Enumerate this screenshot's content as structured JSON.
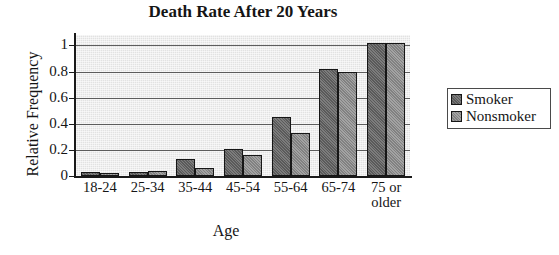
{
  "chart_data": {
    "type": "bar",
    "title": "Death Rate After 20 Years",
    "xlabel": "Age",
    "ylabel": "Relative Frequency",
    "categories": [
      "18-24",
      "25-34",
      "35-44",
      "45-54",
      "55-64",
      "65-74",
      "75 or\nolder"
    ],
    "series": [
      {
        "name": "Smoker",
        "color": "#6e6e6e",
        "values": [
          0.03,
          0.03,
          0.13,
          0.21,
          0.45,
          0.82,
          1.02
        ]
      },
      {
        "name": "Nonsmoker",
        "color": "#949494",
        "values": [
          0.02,
          0.035,
          0.06,
          0.16,
          0.33,
          0.8,
          1.02
        ]
      }
    ],
    "ylim": [
      0,
      1.08
    ],
    "yticks": [
      0,
      0.2,
      0.4,
      0.6,
      0.8,
      1
    ],
    "ytick_labels": [
      "0",
      "0.2",
      "0.4",
      "0.6",
      "0.8",
      "1"
    ],
    "grid": true,
    "legend_position": "right",
    "plot_background": "#e2e2e2",
    "axis_color": "#1a1a1a"
  },
  "legend": {
    "items": [
      {
        "label": "Smoker"
      },
      {
        "label": "Nonsmoker"
      }
    ]
  }
}
